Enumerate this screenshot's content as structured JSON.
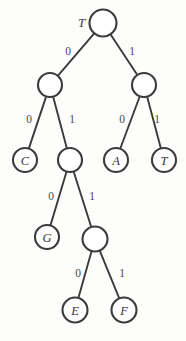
{
  "figure": {
    "kind": "binary-code-tree",
    "width": 186,
    "height": 341,
    "background_color": "#fdfdfc",
    "ink_color": "#3b3b3b",
    "root_outside_label": "T"
  },
  "nodes": [
    {
      "id": "root",
      "label": "",
      "outside_label": "T",
      "cx": 103,
      "cy": 23,
      "r": 13.5,
      "leaf": false,
      "code": ""
    },
    {
      "id": "n0",
      "label": "",
      "outside_label": "",
      "cx": 50,
      "cy": 85,
      "r": 12.0,
      "leaf": false,
      "code": "0"
    },
    {
      "id": "n1",
      "label": "",
      "outside_label": "",
      "cx": 144,
      "cy": 85,
      "r": 12.0,
      "leaf": false,
      "code": "1"
    },
    {
      "id": "n00",
      "label": "C",
      "outside_label": "",
      "cx": 25,
      "cy": 160,
      "r": 12.0,
      "leaf": true,
      "code": "00"
    },
    {
      "id": "n01",
      "label": "",
      "outside_label": "",
      "cx": 70,
      "cy": 160,
      "r": 12.0,
      "leaf": false,
      "code": "01"
    },
    {
      "id": "n10",
      "label": "A",
      "outside_label": "",
      "cx": 116,
      "cy": 160,
      "r": 12.0,
      "leaf": true,
      "code": "10"
    },
    {
      "id": "n11",
      "label": "T",
      "outside_label": "",
      "cx": 164,
      "cy": 160,
      "r": 12.0,
      "leaf": true,
      "code": "11"
    },
    {
      "id": "n010",
      "label": "G",
      "outside_label": "",
      "cx": 47,
      "cy": 237,
      "r": 12.0,
      "leaf": true,
      "code": "010"
    },
    {
      "id": "n011",
      "label": "",
      "outside_label": "",
      "cx": 95,
      "cy": 239,
      "r": 12.5,
      "leaf": false,
      "code": "011"
    },
    {
      "id": "n0110",
      "label": "E",
      "outside_label": "",
      "cx": 75,
      "cy": 310,
      "r": 12.5,
      "leaf": true,
      "code": "0110"
    },
    {
      "id": "n0111",
      "label": "F",
      "outside_label": "",
      "cx": 124,
      "cy": 310,
      "r": 12.5,
      "leaf": true,
      "code": "0111"
    }
  ],
  "edges": [
    {
      "from": "root",
      "to": "n0",
      "label": "0",
      "label_x": 68,
      "label_y": 51
    },
    {
      "from": "root",
      "to": "n1",
      "label": "1",
      "label_x": 132,
      "label_y": 51
    },
    {
      "from": "n0",
      "to": "n00",
      "label": "0",
      "label_x": 29,
      "label_y": 119
    },
    {
      "from": "n0",
      "to": "n01",
      "label": "1",
      "label_x": 72,
      "label_y": 119
    },
    {
      "from": "n1",
      "to": "n10",
      "label": "0",
      "label_x": 122,
      "label_y": 119
    },
    {
      "from": "n1",
      "to": "n11",
      "label": "1",
      "label_x": 157,
      "label_y": 119
    },
    {
      "from": "n01",
      "to": "n010",
      "label": "0",
      "label_x": 51,
      "label_y": 196
    },
    {
      "from": "n01",
      "to": "n011",
      "label": "1",
      "label_x": 92,
      "label_y": 196
    },
    {
      "from": "n011",
      "to": "n0110",
      "label": "0",
      "label_x": 78,
      "label_y": 273
    },
    {
      "from": "n011",
      "to": "n0111",
      "label": "1",
      "label_x": 122,
      "label_y": 273
    }
  ],
  "legend": {
    "leaf_symbols": [
      "C",
      "A",
      "T",
      "G",
      "E",
      "F"
    ],
    "edge_symbols": [
      "0",
      "1"
    ]
  }
}
